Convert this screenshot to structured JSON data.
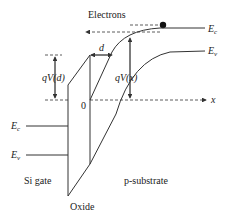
{
  "diagram": {
    "labels": {
      "electrons": "Electrons",
      "ec_right": "E",
      "ec_right_sub": "c",
      "ev_right": "E",
      "ev_right_sub": "v",
      "ec_left": "E",
      "ec_left_sub": "c",
      "ev_left": "E",
      "ev_left_sub": "v",
      "d": "d",
      "qVd": "qV(d)",
      "qVx": "qV(x)",
      "origin": "0",
      "x_axis": "x",
      "si_gate": "Si gate",
      "oxide": "Oxide",
      "p_substrate": "p-substrate"
    },
    "regions": [
      "Si gate",
      "Oxide",
      "p-substrate"
    ],
    "colors": {
      "line": "#333333",
      "text": "#222222",
      "background": "#ffffff"
    }
  }
}
